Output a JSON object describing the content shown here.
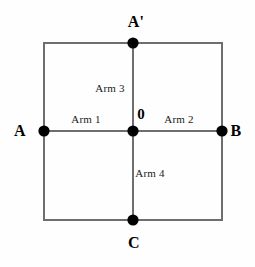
{
  "figure": {
    "background_color": "#fefefe",
    "line_color": "#6e6e6e",
    "node_color": "#000000",
    "text_color": "#000000"
  },
  "vertices": {
    "top": {
      "label": "A'",
      "x": 133,
      "y": 43,
      "label_x": 136,
      "label_y": 22
    },
    "left": {
      "label": "A",
      "x": 44,
      "y": 131,
      "label_x": 20,
      "label_y": 131
    },
    "right": {
      "label": "B",
      "x": 222,
      "y": 131,
      "label_x": 236,
      "label_y": 131
    },
    "bottom": {
      "label": "C",
      "x": 133,
      "y": 220,
      "label_x": 134,
      "label_y": 243
    },
    "center": {
      "label": "0",
      "x": 133,
      "y": 131,
      "label_x": 141,
      "label_y": 114
    }
  },
  "arms": [
    {
      "label": "Arm 1",
      "x": 86,
      "y": 119
    },
    {
      "label": "Arm 2",
      "x": 179,
      "y": 119
    },
    {
      "label": "Arm 3",
      "x": 110,
      "y": 88
    },
    {
      "label": "Arm 4",
      "x": 150,
      "y": 173
    }
  ],
  "geometry": {
    "square": {
      "left": 44,
      "top": 43,
      "right": 222,
      "bottom": 220
    },
    "stroke_width": 2,
    "node_radius": 5.6
  }
}
